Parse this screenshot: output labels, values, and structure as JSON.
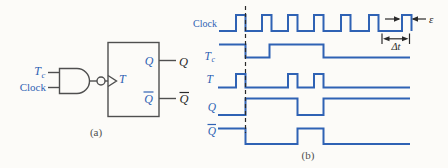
{
  "colors": {
    "signal_blue": "#2f62b4",
    "circuit_line": "#4f4f4f",
    "annotation_black": "#2a2a2a",
    "background": "#fcfbf8"
  },
  "circuit": {
    "caption": "(a)",
    "labels": {
      "input_t_main": "T",
      "input_t_sub": "c",
      "input_clock": "Clock",
      "t_input": "T",
      "q_internal": "Q",
      "qbar_internal": "Q",
      "q_external": "Q",
      "qbar_external": "Q"
    }
  },
  "timing": {
    "caption": "(b)",
    "labels": {
      "clock": "Clock",
      "tc_main": "T",
      "tc_sub": "c",
      "t": "T",
      "q": "Q",
      "qbar": "Q"
    },
    "annotations": {
      "pulse_width": "ε",
      "period": "Δt"
    },
    "waveforms": [
      {
        "name": "clock",
        "points": [
          [
            219,
            31
          ],
          [
            236,
            31
          ],
          [
            236,
            15
          ],
          [
            245.5,
            15
          ],
          [
            245.5,
            31
          ],
          [
            262,
            31
          ],
          [
            262,
            15
          ],
          [
            271.5,
            15
          ],
          [
            271.5,
            31
          ],
          [
            288,
            31
          ],
          [
            288,
            15
          ],
          [
            297.5,
            15
          ],
          [
            297.5,
            31
          ],
          [
            314,
            31
          ],
          [
            314,
            15
          ],
          [
            323.5,
            15
          ],
          [
            323.5,
            31
          ],
          [
            341,
            31
          ],
          [
            341,
            15
          ],
          [
            350.5,
            15
          ],
          [
            350.5,
            31
          ],
          [
            369,
            31
          ],
          [
            369,
            15
          ],
          [
            378.5,
            15
          ],
          [
            378.5,
            31
          ],
          [
            402,
            31
          ],
          [
            402,
            15
          ],
          [
            411.5,
            15
          ],
          [
            411.5,
            31
          ]
        ]
      },
      {
        "name": "tc",
        "points": [
          [
            219,
            44.5
          ],
          [
            245.5,
            44.5
          ],
          [
            245.5,
            57.5
          ],
          [
            269.5,
            57.5
          ],
          [
            269.5,
            44.5
          ],
          [
            323.5,
            44.5
          ],
          [
            323.5,
            57.5
          ],
          [
            410,
            57.5
          ]
        ]
      },
      {
        "name": "t",
        "points": [
          [
            218,
            87.5
          ],
          [
            236,
            87.5
          ],
          [
            236,
            74
          ],
          [
            245.5,
            74
          ],
          [
            245.5,
            87.5
          ],
          [
            288,
            87.5
          ],
          [
            288,
            74
          ],
          [
            297.5,
            74
          ],
          [
            297.5,
            87.5
          ],
          [
            314,
            87.5
          ],
          [
            314,
            74
          ],
          [
            323.5,
            74
          ],
          [
            323.5,
            87.5
          ],
          [
            410,
            87.5
          ]
        ]
      },
      {
        "name": "q",
        "points": [
          [
            218,
            115
          ],
          [
            245.5,
            115
          ],
          [
            245.5,
            98.5
          ],
          [
            297.5,
            98.5
          ],
          [
            297.5,
            115
          ],
          [
            323.5,
            115
          ],
          [
            323.5,
            98.5
          ],
          [
            410,
            98.5
          ]
        ]
      },
      {
        "name": "qbar",
        "points": [
          [
            218,
            128.5
          ],
          [
            245.5,
            128.5
          ],
          [
            245.5,
            144
          ],
          [
            297.5,
            144
          ],
          [
            297.5,
            128.5
          ],
          [
            323.5,
            128.5
          ],
          [
            323.5,
            144
          ],
          [
            410,
            144
          ]
        ]
      }
    ],
    "dashed_line": {
      "x": 245.5,
      "y1": 6,
      "y2": 133
    },
    "annotation_shapes": [
      {
        "kind": "line",
        "name": "epsilon-arrow-right-shaft",
        "x1": 385,
        "y1": 19,
        "x2": 399,
        "y2": 19
      },
      {
        "kind": "polygon",
        "name": "epsilon-arrow-right-head",
        "points": "400.5,19 394,16.3 394,21.7"
      },
      {
        "kind": "line",
        "name": "epsilon-arrow-left-shaft",
        "x1": 413,
        "y1": 19,
        "x2": 426,
        "y2": 19
      },
      {
        "kind": "polygon",
        "name": "epsilon-arrow-left-head",
        "points": "411.5,19 418,16.3 418,21.7"
      },
      {
        "kind": "line",
        "name": "delta-t-tick-left",
        "x1": 382,
        "y1": 33.5,
        "x2": 382,
        "y2": 44
      },
      {
        "kind": "line",
        "name": "delta-t-tick-right",
        "x1": 409.5,
        "y1": 33.5,
        "x2": 409.5,
        "y2": 44
      },
      {
        "kind": "line",
        "name": "delta-t-arrow-shaft",
        "x1": 385.5,
        "y1": 38.8,
        "x2": 406,
        "y2": 38.8
      },
      {
        "kind": "polygon",
        "name": "delta-t-arrow-left-head",
        "points": "383,38.8 389.5,36.3 389.5,41.3"
      },
      {
        "kind": "polygon",
        "name": "delta-t-arrow-right-head",
        "points": "408.5,38.8 402,36.3 402,41.3"
      }
    ]
  }
}
